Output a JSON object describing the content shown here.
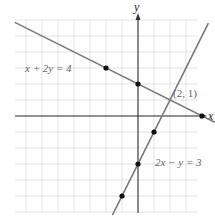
{
  "chart_data": {
    "type": "line",
    "title": "",
    "xlabel": "x",
    "ylabel": "y",
    "xlim": [
      -7.7,
      3.8
    ],
    "ylim": [
      -6,
      6
    ],
    "grid": true,
    "grid_step": 1,
    "series": [
      {
        "name": "x + 2y = 4",
        "equation": "x + 2y = 4",
        "slope": -0.5,
        "intercept": 2,
        "points": [
          [
            -2,
            3
          ],
          [
            0,
            2
          ],
          [
            4,
            0
          ]
        ],
        "color": "#7a7a7a"
      },
      {
        "name": "2x − y = 3",
        "equation": "2x − y = 3",
        "slope": 2,
        "intercept": -3,
        "points": [
          [
            -1,
            -5
          ],
          [
            0,
            -3
          ],
          [
            1,
            -1
          ]
        ],
        "color": "#7a7a7a"
      }
    ],
    "annotations": [
      {
        "text": "x + 2y = 4",
        "x": -5.6,
        "y": 3
      },
      {
        "text": "2x − y = 3",
        "x": 1.6,
        "y": -3
      },
      {
        "text": "(2, 1)",
        "x": 2.2,
        "y": 1.5
      }
    ],
    "intersection": {
      "label": "(2, 1)",
      "x": 2,
      "y": 1
    }
  },
  "labels": {
    "x_axis": "x",
    "y_axis": "y",
    "eq1": "x + 2y = 4",
    "eq2": "2x − y = 3",
    "intersection": "(2, 1)"
  },
  "colors": {
    "grid": "#dcdcdc",
    "axis": "#333333",
    "line": "#7a7a7a",
    "point": "#111111"
  }
}
